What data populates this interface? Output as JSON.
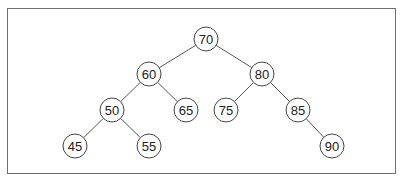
{
  "diagram": {
    "type": "binary-search-tree",
    "nodes": [
      {
        "id": "n70",
        "label": "70",
        "x": 206,
        "y": 39
      },
      {
        "id": "n60",
        "label": "60",
        "x": 149,
        "y": 74
      },
      {
        "id": "n80",
        "label": "80",
        "x": 262,
        "y": 74
      },
      {
        "id": "n50",
        "label": "50",
        "x": 112,
        "y": 110
      },
      {
        "id": "n65",
        "label": "65",
        "x": 186,
        "y": 110
      },
      {
        "id": "n75",
        "label": "75",
        "x": 226,
        "y": 110
      },
      {
        "id": "n85",
        "label": "85",
        "x": 298,
        "y": 110
      },
      {
        "id": "n45",
        "label": "45",
        "x": 75,
        "y": 146
      },
      {
        "id": "n55",
        "label": "55",
        "x": 149,
        "y": 146
      },
      {
        "id": "n90",
        "label": "90",
        "x": 332,
        "y": 146
      }
    ],
    "edges": [
      {
        "from": "n70",
        "to": "n60"
      },
      {
        "from": "n70",
        "to": "n80"
      },
      {
        "from": "n60",
        "to": "n50"
      },
      {
        "from": "n60",
        "to": "n65"
      },
      {
        "from": "n80",
        "to": "n75"
      },
      {
        "from": "n80",
        "to": "n85"
      },
      {
        "from": "n50",
        "to": "n45"
      },
      {
        "from": "n50",
        "to": "n55"
      },
      {
        "from": "n85",
        "to": "n90"
      }
    ],
    "node_radius": 12
  }
}
